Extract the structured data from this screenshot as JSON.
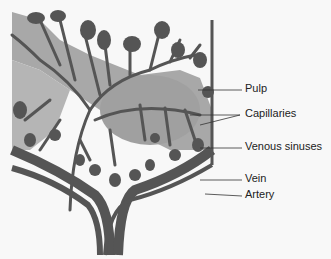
{
  "diagram": {
    "colors": {
      "background": "#f8f8f8",
      "pulp": "#a8a8a8",
      "vessel": "#555555",
      "outline": "#333333",
      "label_text": "#222222"
    },
    "labels": [
      {
        "id": "pulp",
        "text": "Pulp"
      },
      {
        "id": "capillaries",
        "text": "Capillaries"
      },
      {
        "id": "venous-sinuses",
        "text": "Venous sinuses"
      },
      {
        "id": "vein",
        "text": "Vein"
      },
      {
        "id": "artery",
        "text": "Artery"
      }
    ]
  }
}
